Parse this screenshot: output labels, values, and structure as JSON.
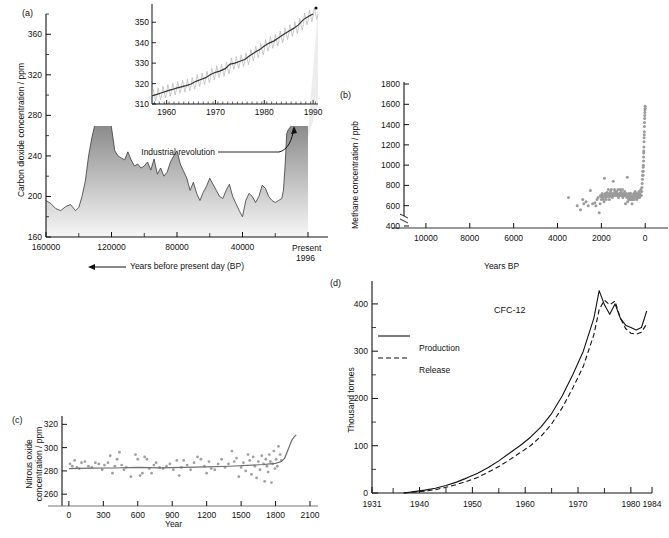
{
  "figure": {
    "panels": [
      "(a)",
      "(b)",
      "(c)",
      "(d)"
    ]
  },
  "panel_a": {
    "tag": "(a)",
    "ylabel": "Carbon dioxide concentration / ppm",
    "xlabel": "Years before present day (BP)",
    "x_end_label_1": "Present",
    "x_end_label_2": "1996",
    "annotation": "Industrial revolution",
    "yticks": [
      "160",
      "200",
      "240",
      "280",
      "320",
      "360"
    ],
    "xticks": [
      "160000",
      "120000",
      "80000",
      "40000"
    ]
  },
  "panel_a_inset": {
    "yticks": [
      "310",
      "320",
      "330",
      "340",
      "350"
    ],
    "xticks": [
      "1960",
      "1970",
      "1980",
      "1990"
    ]
  },
  "panel_b": {
    "tag": "(b)",
    "ylabel": "Methane concentration / ppb",
    "xlabel": "Years BP",
    "yticks": [
      "400",
      "600",
      "800",
      "1000",
      "1200",
      "1400",
      "1600",
      "1800"
    ],
    "xticks": [
      "10000",
      "8000",
      "6000",
      "4000",
      "2000",
      "0"
    ]
  },
  "panel_c": {
    "tag": "(c)",
    "ylabel_line1": "Nitrous oxide",
    "ylabel_line2": "concentration / ppm",
    "xlabel": "Year",
    "yticks": [
      "260",
      "280",
      "300",
      "320"
    ],
    "xticks": [
      "0",
      "300",
      "600",
      "900",
      "1200",
      "1500",
      "1800",
      "2100"
    ]
  },
  "panel_d": {
    "tag": "(d)",
    "ylabel": "Thousand tonnes",
    "title": "CFC-12",
    "legend": [
      "Production",
      "Release"
    ],
    "yticks": [
      "0",
      "100",
      "200",
      "300",
      "400"
    ],
    "xticks": [
      "1931",
      "1940",
      "1950",
      "1960",
      "1970",
      "1980",
      "1984"
    ]
  },
  "chart_data": [
    {
      "type": "area",
      "panel": "(a)",
      "title": "",
      "xlabel": "Years before present day (BP)",
      "ylabel": "Carbon dioxide concentration / ppm",
      "xlim": [
        160000,
        0
      ],
      "ylim": [
        160,
        380
      ],
      "x_reversed": true,
      "grid": false,
      "annotations": [
        "Industrial revolution"
      ],
      "x": [
        160000,
        157000,
        154000,
        151000,
        148000,
        145000,
        142000,
        140000,
        138000,
        136000,
        134000,
        132000,
        130000,
        128000,
        127000,
        126000,
        125000,
        124000,
        123000,
        122000,
        121500,
        121000,
        120500,
        120000,
        118000,
        116000,
        114000,
        112000,
        110000,
        108000,
        106000,
        104000,
        102000,
        100000,
        98000,
        96000,
        94000,
        92000,
        90000,
        88000,
        86000,
        84000,
        82000,
        80000,
        78000,
        76000,
        74000,
        72000,
        70000,
        68000,
        66000,
        64000,
        62000,
        60000,
        58000,
        56000,
        54000,
        52000,
        50000,
        48000,
        46000,
        44000,
        42000,
        40000,
        38000,
        36000,
        34000,
        32000,
        30000,
        28000,
        26000,
        24000,
        22000,
        20000,
        18000,
        16000,
        15000,
        14000,
        13000,
        12000,
        11000,
        10000,
        9000,
        8000,
        6000,
        4000,
        2000,
        1000,
        500,
        250,
        150,
        100,
        50,
        0
      ],
      "y": [
        196,
        193,
        188,
        186,
        190,
        192,
        186,
        189,
        200,
        215,
        240,
        258,
        272,
        285,
        292,
        278,
        270,
        283,
        276,
        283,
        271,
        285,
        274,
        268,
        245,
        240,
        238,
        236,
        244,
        236,
        230,
        232,
        228,
        230,
        234,
        226,
        237,
        222,
        228,
        220,
        224,
        234,
        240,
        245,
        232,
        225,
        218,
        206,
        214,
        203,
        196,
        204,
        210,
        218,
        212,
        206,
        200,
        198,
        206,
        212,
        200,
        193,
        186,
        180,
        196,
        203,
        200,
        194,
        200,
        211,
        208,
        200,
        196,
        194,
        196,
        198,
        206,
        230,
        262,
        266,
        268,
        270,
        272,
        275,
        278,
        280,
        283,
        290,
        300,
        320,
        340,
        355,
        362,
        360
      ]
    },
    {
      "type": "line",
      "panel": "(a)-inset",
      "title": "",
      "xlabel": "",
      "ylabel": "",
      "xlim": [
        1957,
        1991
      ],
      "ylim": [
        310,
        356
      ],
      "grid": false,
      "series": [
        {
          "name": "Mauna Loa CO2 annual mean",
          "x": [
            1957,
            1958,
            1959,
            1960,
            1961,
            1962,
            1963,
            1964,
            1965,
            1966,
            1967,
            1968,
            1969,
            1970,
            1971,
            1972,
            1973,
            1974,
            1975,
            1976,
            1977,
            1978,
            1979,
            1980,
            1981,
            1982,
            1983,
            1984,
            1985,
            1986,
            1987,
            1988,
            1989,
            1990
          ],
          "values": [
            314.0,
            314.7,
            315.5,
            316.3,
            317.0,
            317.8,
            318.4,
            319.0,
            319.8,
            321.1,
            322.0,
            322.9,
            324.4,
            325.5,
            326.2,
            327.3,
            329.5,
            330.0,
            330.9,
            331.8,
            333.6,
            335.2,
            336.5,
            338.4,
            339.8,
            340.9,
            342.5,
            344.1,
            345.6,
            347.0,
            348.7,
            351.3,
            352.8,
            354.0
          ]
        }
      ]
    },
    {
      "type": "scatter",
      "panel": "(b)",
      "title": "",
      "xlabel": "Years BP",
      "ylabel": "Methane concentration / ppb",
      "xlim": [
        11000,
        -400
      ],
      "ylim": [
        380,
        1820
      ],
      "x_reversed": true,
      "grid": false,
      "x": [
        3500,
        3100,
        2950,
        2850,
        2800,
        2700,
        2600,
        2500,
        2400,
        2300,
        2250,
        2200,
        2150,
        2100,
        2060,
        2040,
        2020,
        2000,
        1980,
        1960,
        1940,
        1920,
        1900,
        1880,
        1860,
        1840,
        1820,
        1800,
        1780,
        1760,
        1740,
        1720,
        1700,
        1680,
        1660,
        1640,
        1620,
        1600,
        1580,
        1560,
        1540,
        1520,
        1500,
        1480,
        1460,
        1440,
        1420,
        1400,
        1380,
        1360,
        1340,
        1320,
        1300,
        1280,
        1260,
        1240,
        1220,
        1200,
        1180,
        1160,
        1140,
        1120,
        1100,
        1080,
        1060,
        1040,
        1020,
        1000,
        980,
        960,
        940,
        920,
        900,
        880,
        860,
        840,
        820,
        800,
        780,
        760,
        740,
        720,
        700,
        680,
        660,
        640,
        620,
        600,
        580,
        560,
        540,
        520,
        500,
        480,
        460,
        440,
        420,
        400,
        380,
        360,
        340,
        320,
        300,
        280,
        260,
        240,
        220,
        200,
        180,
        160,
        150,
        140,
        130,
        120,
        110,
        100,
        95,
        90,
        85,
        80,
        75,
        70,
        65,
        60,
        55,
        50,
        45,
        40,
        35,
        30,
        25,
        20,
        15,
        10,
        5,
        0
      ],
      "values": [
        680,
        600,
        560,
        660,
        620,
        640,
        600,
        750,
        620,
        630,
        600,
        660,
        680,
        530,
        620,
        700,
        690,
        660,
        700,
        720,
        680,
        700,
        660,
        640,
        870,
        700,
        720,
        680,
        660,
        700,
        730,
        690,
        720,
        760,
        700,
        660,
        690,
        720,
        740,
        700,
        760,
        720,
        680,
        700,
        840,
        720,
        700,
        760,
        740,
        700,
        720,
        700,
        740,
        720,
        700,
        760,
        680,
        700,
        720,
        700,
        760,
        720,
        740,
        700,
        720,
        760,
        680,
        700,
        720,
        700,
        740,
        700,
        620,
        700,
        720,
        680,
        880,
        640,
        700,
        660,
        720,
        680,
        700,
        660,
        720,
        690,
        660,
        620,
        660,
        700,
        680,
        720,
        660,
        700,
        740,
        700,
        680,
        720,
        660,
        700,
        680,
        720,
        700,
        740,
        680,
        720,
        700,
        760,
        700,
        740,
        780,
        820,
        860,
        900,
        940,
        900,
        940,
        980,
        1000,
        1040,
        1080,
        1120,
        1140,
        1180,
        1230,
        1270,
        1300,
        1330,
        1380,
        1420,
        1460,
        1490,
        1520,
        1545,
        1560,
        1580,
        1600,
        1620,
        1660
      ]
    },
    {
      "type": "scatter",
      "panel": "(c)",
      "title": "",
      "xlabel": "Year",
      "ylabel": "Nitrous oxide concentration / ppm",
      "xlim": [
        -60,
        2100
      ],
      "ylim": [
        255,
        322
      ],
      "grid": false,
      "x": [
        10,
        30,
        50,
        70,
        90,
        110,
        140,
        170,
        200,
        230,
        260,
        290,
        310,
        340,
        360,
        380,
        400,
        420,
        440,
        460,
        480,
        500,
        540,
        580,
        600,
        620,
        640,
        660,
        680,
        700,
        720,
        740,
        760,
        790,
        820,
        850,
        880,
        910,
        940,
        960,
        980,
        1000,
        1030,
        1060,
        1090,
        1120,
        1150,
        1180,
        1200,
        1220,
        1240,
        1270,
        1300,
        1330,
        1360,
        1390,
        1420,
        1440,
        1460,
        1480,
        1500,
        1520,
        1540,
        1560,
        1575,
        1590,
        1605,
        1620,
        1635,
        1650,
        1665,
        1680,
        1695,
        1705,
        1715,
        1725,
        1735,
        1745,
        1755,
        1765,
        1775,
        1785,
        1795,
        1805,
        1815,
        1825,
        1840,
        1850
      ],
      "values": [
        286,
        284,
        289,
        283,
        282,
        287,
        288,
        284,
        283,
        287,
        286,
        281,
        285,
        287,
        293,
        278,
        284,
        290,
        296,
        285,
        281,
        283,
        275,
        294,
        290,
        276,
        278,
        292,
        290,
        282,
        278,
        285,
        287,
        283,
        282,
        284,
        286,
        281,
        289,
        276,
        283,
        289,
        285,
        281,
        287,
        292,
        290,
        284,
        278,
        288,
        282,
        281,
        286,
        290,
        283,
        286,
        297,
        288,
        291,
        275,
        283,
        287,
        280,
        294,
        289,
        277,
        292,
        284,
        274,
        288,
        281,
        293,
        286,
        271,
        290,
        284,
        279,
        294,
        288,
        270,
        286,
        297,
        282,
        290,
        284,
        301,
        294,
        289
      ],
      "trend": {
        "name": "smoothed trend",
        "x": [
          0,
          200,
          400,
          600,
          800,
          1000,
          1200,
          1400,
          1600,
          1700,
          1750,
          1800,
          1850,
          1880,
          1900,
          1920,
          1940,
          1960,
          1980
        ],
        "values": [
          282,
          282.3,
          282.5,
          283,
          282.6,
          283,
          283.4,
          284,
          285,
          285.5,
          286,
          286.5,
          288,
          291,
          296,
          301,
          306,
          309,
          311
        ]
      }
    },
    {
      "type": "line",
      "panel": "(d)",
      "title": "CFC-12",
      "xlabel": "",
      "ylabel": "Thousand tonnes",
      "xlim": [
        1931,
        1984
      ],
      "ylim": [
        0,
        440
      ],
      "grid": false,
      "series": [
        {
          "name": "Production",
          "style": "solid",
          "x": [
            1937,
            1939,
            1941,
            1943,
            1945,
            1947,
            1949,
            1951,
            1953,
            1955,
            1957,
            1959,
            1961,
            1963,
            1965,
            1967,
            1969,
            1971,
            1973,
            1974,
            1975,
            1976,
            1977,
            1978,
            1979,
            1980,
            1981,
            1982,
            1983
          ],
          "values": [
            0,
            3,
            6,
            10,
            16,
            23,
            32,
            42,
            54,
            68,
            84,
            100,
            118,
            140,
            168,
            205,
            250,
            300,
            370,
            428,
            398,
            378,
            400,
            370,
            355,
            350,
            345,
            350,
            385
          ]
        },
        {
          "name": "Release",
          "style": "dashed",
          "x": [
            1937,
            1939,
            1941,
            1943,
            1945,
            1947,
            1949,
            1951,
            1953,
            1955,
            1957,
            1959,
            1961,
            1963,
            1965,
            1967,
            1969,
            1971,
            1973,
            1974,
            1975,
            1976,
            1977,
            1978,
            1979,
            1980,
            1981,
            1982,
            1983
          ],
          "values": [
            0,
            2,
            4,
            7,
            12,
            18,
            25,
            33,
            44,
            56,
            70,
            85,
            100,
            120,
            146,
            180,
            222,
            268,
            335,
            388,
            408,
            398,
            406,
            370,
            348,
            338,
            336,
            340,
            358
          ]
        }
      ]
    }
  ]
}
